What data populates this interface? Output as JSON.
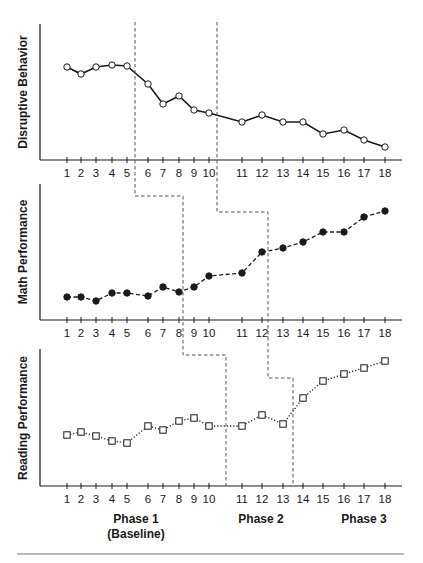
{
  "chart_data": {
    "type": "line",
    "title": "",
    "design": "multiple-baseline across behaviors",
    "xlabel": "Sessions",
    "x": [
      1,
      2,
      3,
      4,
      5,
      6,
      7,
      8,
      9,
      10,
      11,
      12,
      13,
      14,
      15,
      16,
      17,
      18
    ],
    "grid": false,
    "legend": null,
    "panels": [
      {
        "name": "Disruptive Behavior",
        "ylabel": "Disruptive Behavior",
        "marker": "open-circle",
        "line_style": "solid",
        "y_units": "relative (no numeric axis)",
        "values": [
          67,
          74,
          67,
          65,
          66,
          84,
          104,
          96,
          110,
          113,
          122,
          115,
          122,
          122,
          134,
          130,
          140,
          147
        ],
        "values_relative_0_100": [
          69,
          63,
          69,
          70,
          69,
          56,
          41,
          47,
          37,
          35,
          28,
          33,
          28,
          28,
          19,
          22,
          15,
          10
        ],
        "phase_change_after": [
          5,
          10
        ]
      },
      {
        "name": "Math Performance",
        "ylabel": "Math Performance",
        "marker": "filled-circle",
        "line_style": "dashed",
        "y_units": "relative (no numeric axis)",
        "values": [
          297,
          297,
          301,
          293,
          293,
          296,
          287,
          292,
          287,
          276,
          273,
          252,
          248,
          242,
          232,
          232,
          217,
          211
        ],
        "values_relative_0_100": [
          17,
          17,
          14,
          20,
          20,
          18,
          24,
          21,
          24,
          32,
          35,
          50,
          53,
          57,
          65,
          65,
          76,
          80
        ],
        "phase_change_after": [
          8,
          12
        ]
      },
      {
        "name": "Reading Performance",
        "ylabel": "Reading Performance",
        "marker": "open-square",
        "line_style": "dotted",
        "y_units": "relative (no numeric axis)",
        "values": [
          435,
          432,
          436,
          441,
          443,
          426,
          430,
          421,
          418,
          426,
          426,
          415,
          424,
          398,
          381,
          374,
          368,
          361
        ],
        "values_relative_0_100": [
          37,
          39,
          37,
          33,
          31,
          44,
          41,
          47,
          50,
          44,
          44,
          52,
          45,
          64,
          77,
          82,
          86,
          91
        ],
        "phase_change_after": [
          10,
          13
        ]
      }
    ],
    "tick_labels": [
      "1",
      "2",
      "3",
      "4",
      "5",
      "6",
      "7",
      "8",
      "9",
      "10",
      "11",
      "12",
      "13",
      "14",
      "15",
      "16",
      "17",
      "18"
    ],
    "phase_labels": [
      {
        "line1": "Phase 1",
        "line2": "(Baseline)"
      },
      {
        "line1": "Phase 2",
        "line2": ""
      },
      {
        "line1": "Phase 3",
        "line2": ""
      }
    ],
    "colors": {
      "ink": "#1a1a1a",
      "phase_line": "#555555",
      "background": "#ffffff"
    }
  },
  "labels": {
    "panel1_ylabel": "Disruptive Behavior",
    "panel2_ylabel": "Math Performance",
    "panel3_ylabel": "Reading Performance",
    "phase1": "Phase 1",
    "phase1_sub": "(Baseline)",
    "phase2": "Phase 2",
    "phase3": "Phase 3"
  }
}
